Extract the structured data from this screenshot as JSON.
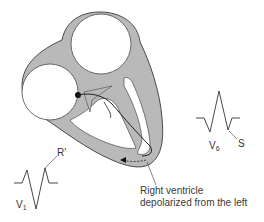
{
  "diagram": {
    "type": "heart-conduction-schematic",
    "colors": {
      "wall_fill": "#b9b9b9",
      "wall_stroke": "#4a4a4a",
      "trace": "#333333",
      "background": "#ffffff"
    }
  },
  "labels": {
    "v1": {
      "lead": "V",
      "sub": "1",
      "wave_label": "R′"
    },
    "v6": {
      "lead": "V",
      "sub": "6",
      "wave_label": "S"
    },
    "caption_line1": "Right ventricle",
    "caption_line2": "depolarized from the left"
  }
}
